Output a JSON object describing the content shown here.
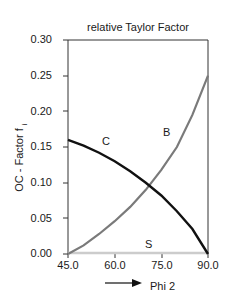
{
  "chart_data": {
    "type": "line",
    "title": "relative Taylor Factor",
    "xlabel": "Phi 2",
    "ylabel": "OC - Factor f",
    "ylabel_subscript": "i",
    "xlim": [
      45.0,
      90.0
    ],
    "ylim": [
      0.0,
      0.3
    ],
    "xticks": [
      "45.0",
      "60.0",
      "75.0",
      "90.0"
    ],
    "yticks": [
      "0.00",
      "0.05",
      "0.10",
      "0.15",
      "0.20",
      "0.25",
      "0.30"
    ],
    "grid": false,
    "legend": "none (inline curve labels)",
    "x": [
      45,
      50,
      55,
      60,
      65,
      70,
      75,
      80,
      85,
      90
    ],
    "series": [
      {
        "name": "C",
        "color": "#111111",
        "values": [
          0.16,
          0.152,
          0.142,
          0.13,
          0.116,
          0.1,
          0.082,
          0.06,
          0.035,
          0.0
        ]
      },
      {
        "name": "B",
        "color": "#7a7a7a",
        "values": [
          0.0,
          0.012,
          0.028,
          0.046,
          0.066,
          0.09,
          0.118,
          0.15,
          0.195,
          0.25
        ]
      },
      {
        "name": "S",
        "color": "#cccccc",
        "values": [
          0.0,
          0.0,
          0.0,
          0.0,
          0.0,
          0.0,
          0.0,
          0.0,
          0.0,
          0.0
        ]
      }
    ],
    "annotations": [
      "C",
      "B",
      "S"
    ],
    "x_arrow": true
  }
}
